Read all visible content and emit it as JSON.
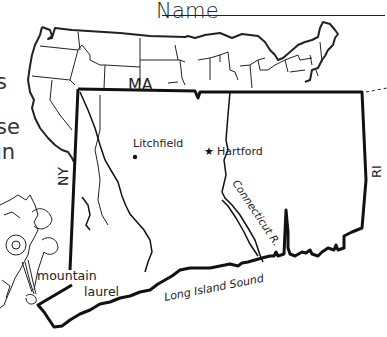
{
  "worksheet": {
    "name_label": "Name",
    "left_text_fragments": [
      "s",
      "se",
      "in"
    ]
  },
  "map": {
    "state_labels": {
      "north": "MA",
      "west": "NY",
      "east": "RI"
    },
    "cities": [
      {
        "name": "Litchfield",
        "marker": "dot"
      },
      {
        "name": "Hartford",
        "marker": "star",
        "capital": true
      }
    ],
    "river_label": "Connecticut R.",
    "water_label": "Long Island Sound",
    "state_flower_label_line1": "mountain",
    "state_flower_label_line2": "laurel"
  }
}
